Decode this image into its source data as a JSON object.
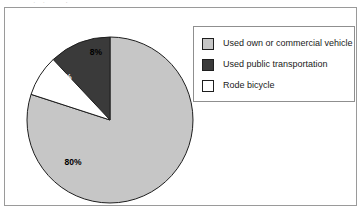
{
  "figure": {
    "background_color": "#ffffff",
    "frame_border_color": "#9a9a9a",
    "top_clipped_text": "commute to work"
  },
  "legend": {
    "position": "top-right",
    "border_color": "#8f8f8f",
    "items": [
      {
        "label": "Used own or commercial vehicle",
        "color": "#c6c6c6"
      },
      {
        "label": "Used public transportation",
        "color": "#3a3a3a"
      },
      {
        "label": "Rode bicycle",
        "color": "#ffffff"
      }
    ]
  },
  "chart_data": {
    "type": "pie",
    "title": "",
    "subtitle": "",
    "xlabel": "",
    "ylabel": "",
    "grid": false,
    "legend_position": "top-right",
    "start_angle_oclock": 12,
    "direction": "clockwise",
    "center": {
      "x": 95,
      "y": 92
    },
    "radius": 83,
    "labels": [
      "Used own or commercial vehicle",
      "Used public transportation",
      "Rode bicycle"
    ],
    "values": [
      80,
      12,
      8
    ],
    "value_labels": [
      "80%",
      "12%",
      "8%"
    ],
    "colors": [
      "#c6c6c6",
      "#3a3a3a",
      "#ffffff"
    ],
    "slice_order_clockwise": [
      {
        "label": "Used own or commercial vehicle",
        "value": 80,
        "value_label": "80%",
        "color": "#c6c6c6",
        "label_text_color": "#000000"
      },
      {
        "label": "Rode bicycle",
        "value": 8,
        "value_label": "8%",
        "color": "#ffffff",
        "label_text_color": "#000000"
      },
      {
        "label": "Used public transportation",
        "value": 12,
        "value_label": "12%",
        "color": "#3a3a3a",
        "label_text_color": "#ffffff"
      }
    ],
    "label_positions": [
      {
        "value_label": "80%",
        "x": 58,
        "y": 137
      },
      {
        "value_label": "12%",
        "x": 48,
        "y": 52
      },
      {
        "value_label": "8%",
        "x": 81,
        "y": 27
      }
    ]
  }
}
